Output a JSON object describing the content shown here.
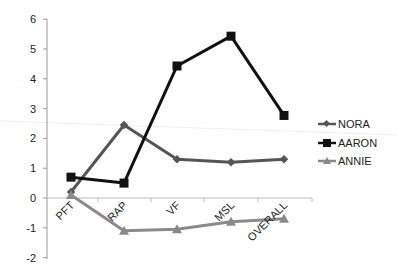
{
  "chart_data": {
    "type": "line",
    "title": "",
    "xlabel": "",
    "ylabel": "",
    "categories": [
      "PFT",
      "RAP",
      "VF",
      "MSL",
      "OVERALL"
    ],
    "ylim": [
      -2,
      6
    ],
    "yticks": [
      "-2",
      "-1",
      "0",
      "1",
      "2",
      "3",
      "4",
      "5",
      "6"
    ],
    "grid": false,
    "legend_position": "right",
    "series": [
      {
        "name": "NORA",
        "marker": "diamond",
        "color": "#555555",
        "values": [
          0.2,
          2.45,
          1.3,
          1.2,
          1.3
        ]
      },
      {
        "name": "AARON",
        "marker": "square",
        "color": "#111111",
        "values": [
          0.7,
          0.5,
          4.43,
          5.43,
          2.77
        ]
      },
      {
        "name": "ANNIE",
        "marker": "triangle",
        "color": "#8a8a8a",
        "values": [
          0.1,
          -1.1,
          -1.05,
          -0.8,
          -0.7
        ]
      }
    ]
  },
  "legend": {
    "items": [
      {
        "label": "NORA"
      },
      {
        "label": "AARON"
      },
      {
        "label": "ANNIE"
      }
    ]
  }
}
